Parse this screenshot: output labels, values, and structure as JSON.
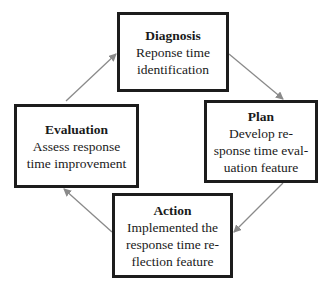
{
  "diagram": {
    "type": "cycle",
    "colors": {
      "box_border": "#1c1c1c",
      "arrow": "#8a8a8a",
      "background": "#ffffff"
    },
    "nodes": {
      "diagnosis": {
        "title": "Diagnosis",
        "desc": "Reponse time\nidentification"
      },
      "plan": {
        "title": "Plan",
        "desc": "Develop re-\nsponse time eval-\nuation feature"
      },
      "action": {
        "title": "Action",
        "desc": "Implemented the\nresponse time re-\nflection feature"
      },
      "evaluation": {
        "title": "Evaluation",
        "desc": "Assess response\ntime improvement"
      }
    },
    "edges": [
      {
        "from": "Diagnosis",
        "to": "Plan"
      },
      {
        "from": "Plan",
        "to": "Action"
      },
      {
        "from": "Action",
        "to": "Evaluation"
      },
      {
        "from": "Evaluation",
        "to": "Diagnosis"
      }
    ]
  }
}
